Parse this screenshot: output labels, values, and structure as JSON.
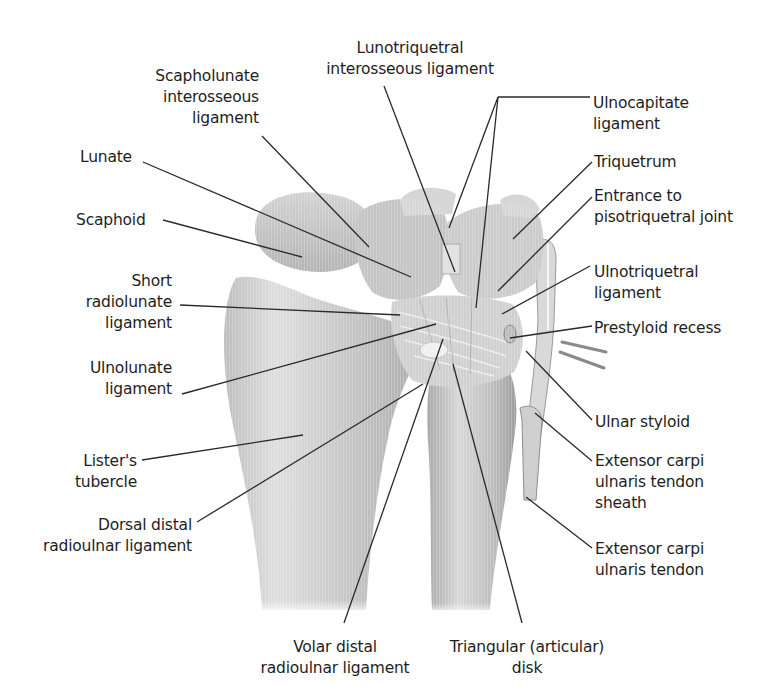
{
  "figure": {
    "colors": {
      "background": "#ffffff",
      "bone": "#c9c9c9",
      "bone_light": "#e4e4e4",
      "bone_shadow": "#9a9a9a",
      "leader": "#2a2a2a",
      "text": "#1e1e1e"
    }
  },
  "labels": [
    {
      "id": "lunotriquetral",
      "lines": [
        "Lunotriquetral",
        "interosseous ligament"
      ],
      "x": 305,
      "y": 38,
      "align": "c",
      "width": 210,
      "leaders": [
        [
          384,
          86,
          455,
          272
        ]
      ]
    },
    {
      "id": "scapholunate",
      "lines": [
        "Scapholunate",
        "interosseous",
        "ligament"
      ],
      "x": 125,
      "y": 66,
      "align": "r",
      "width": 134,
      "leaders": [
        [
          262,
          136,
          369,
          247
        ]
      ]
    },
    {
      "id": "ulnocapitate",
      "lines": [
        "Ulnocapitate",
        "ligament"
      ],
      "x": 593,
      "y": 93,
      "align": "l",
      "width": 150,
      "leaders": [
        [
          590,
          97,
          498,
          97
        ],
        [
          498,
          97,
          449,
          228
        ],
        [
          498,
          97,
          476,
          308
        ]
      ]
    },
    {
      "id": "lunate",
      "lines": [
        "Lunate"
      ],
      "x": 80,
      "y": 147,
      "align": "l",
      "width": 90,
      "leaders": [
        [
          143,
          162,
          411,
          277
        ]
      ]
    },
    {
      "id": "triquetrum",
      "lines": [
        "Triquetrum"
      ],
      "x": 594,
      "y": 152,
      "align": "l",
      "width": 120,
      "leaders": [
        [
          592,
          162,
          513,
          239
        ]
      ]
    },
    {
      "id": "entrance-pisotriquetral",
      "lines": [
        "Entrance to",
        "pisotriquetral joint"
      ],
      "x": 594,
      "y": 186,
      "align": "l",
      "width": 180,
      "leaders": [
        [
          592,
          197,
          498,
          291
        ]
      ]
    },
    {
      "id": "scaphoid",
      "lines": [
        "Scaphoid"
      ],
      "x": 76,
      "y": 210,
      "align": "l",
      "width": 110,
      "leaders": [
        [
          163,
          220,
          302,
          257
        ]
      ]
    },
    {
      "id": "ulnotriquetral",
      "lines": [
        "Ulnotriquetral",
        "ligament"
      ],
      "x": 594,
      "y": 262,
      "align": "l",
      "width": 150,
      "leaders": [
        [
          590,
          266,
          502,
          314
        ]
      ]
    },
    {
      "id": "short-radiolunate",
      "lines": [
        "Short",
        "radiolunate",
        "ligament"
      ],
      "x": 80,
      "y": 271,
      "align": "r",
      "width": 92,
      "leaders": [
        [
          180,
          305,
          400,
          315
        ]
      ]
    },
    {
      "id": "prestyloid-recess",
      "lines": [
        "Prestyloid recess"
      ],
      "x": 594,
      "y": 318,
      "align": "l",
      "width": 170,
      "leaders": [
        [
          592,
          326,
          510,
          338
        ]
      ]
    },
    {
      "id": "ulnolunate",
      "lines": [
        "Ulnolunate",
        "ligament"
      ],
      "x": 70,
      "y": 358,
      "align": "r",
      "width": 102,
      "leaders": [
        [
          182,
          394,
          436,
          324
        ]
      ]
    },
    {
      "id": "ulnar-styloid",
      "lines": [
        "Ulnar styloid"
      ],
      "x": 595,
      "y": 412,
      "align": "l",
      "width": 130,
      "leaders": [
        [
          592,
          420,
          526,
          351
        ]
      ]
    },
    {
      "id": "listers-tubercle",
      "lines": [
        "Lister's",
        "tubercle"
      ],
      "x": 60,
      "y": 451,
      "align": "r",
      "width": 77,
      "leaders": [
        [
          142,
          460,
          303,
          435
        ]
      ]
    },
    {
      "id": "ecu-tendon-sheath",
      "lines": [
        "Extensor carpi",
        "ulnaris tendon",
        "sheath"
      ],
      "x": 595,
      "y": 451,
      "align": "l",
      "width": 150,
      "leaders": [
        [
          592,
          461,
          535,
          413
        ]
      ]
    },
    {
      "id": "dorsal-distal-radioulnar",
      "lines": [
        "Dorsal distal",
        "radioulnar ligament"
      ],
      "x": 26,
      "y": 515,
      "align": "r",
      "width": 166,
      "leaders": [
        [
          197,
          522,
          423,
          384
        ]
      ]
    },
    {
      "id": "ecu-tendon",
      "lines": [
        "Extensor carpi",
        "ulnaris tendon"
      ],
      "x": 595,
      "y": 539,
      "align": "l",
      "width": 150,
      "leaders": [
        [
          592,
          548,
          526,
          497
        ]
      ]
    },
    {
      "id": "volar-distal-radioulnar",
      "lines": [
        "Volar distal",
        "radioulnar ligament"
      ],
      "x": 245,
      "y": 637,
      "align": "c",
      "width": 180,
      "leaders": [
        [
          344,
          623,
          443,
          339
        ]
      ]
    },
    {
      "id": "triangular-disk",
      "lines": [
        "Triangular (articular)",
        "disk"
      ],
      "x": 432,
      "y": 637,
      "align": "c",
      "width": 190,
      "leaders": [
        [
          522,
          623,
          453,
          364
        ]
      ]
    }
  ]
}
